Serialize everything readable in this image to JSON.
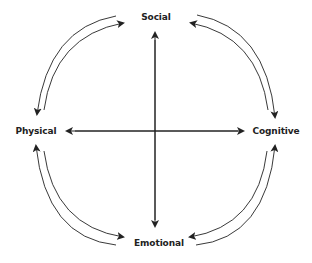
{
  "diagram": {
    "type": "cyclic-dimension-diagram",
    "nodes": {
      "top": "Social",
      "right": "Cognitive",
      "bottom": "Emotional",
      "left": "Physical"
    },
    "axes": [
      {
        "from": "Social",
        "to": "Emotional",
        "bidirectional": true
      },
      {
        "from": "Physical",
        "to": "Cognitive",
        "bidirectional": true
      }
    ],
    "arcs": [
      {
        "between": [
          "Social",
          "Physical"
        ],
        "arrows": [
          "toward Physical",
          "toward Social"
        ]
      },
      {
        "between": [
          "Social",
          "Cognitive"
        ],
        "arrows": [
          "toward Cognitive",
          "toward Social"
        ]
      },
      {
        "between": [
          "Cognitive",
          "Emotional"
        ],
        "arrows": [
          "toward Cognitive",
          "toward Emotional"
        ]
      },
      {
        "between": [
          "Physical",
          "Emotional"
        ],
        "arrows": [
          "toward Physical",
          "toward Emotional"
        ]
      }
    ],
    "colors": {
      "line": "#222222",
      "background": "#ffffff"
    }
  }
}
